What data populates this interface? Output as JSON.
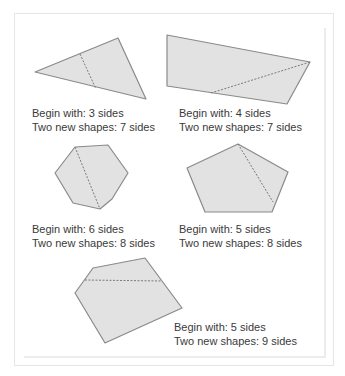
{
  "colors": {
    "shape_fill": "#e2e2e2",
    "shape_stroke": "#8a8a8a",
    "dash_stroke": "#7a7a7a",
    "text": "#3a3a3a"
  },
  "figures": [
    {
      "shape": "triangle",
      "begin_label": "Begin with: 3 sides",
      "result_label": "Two new shapes: 7 sides",
      "points": "35,72 118,38 146,99",
      "cut": [
        80,
        54,
        96,
        89
      ]
    },
    {
      "shape": "quadrilateral",
      "begin_label": "Begin with: 4 sides",
      "result_label": "Two new shapes: 7 sides",
      "points": "167,35 310,62 287,104 167,86",
      "cut": [
        211,
        93,
        310,
        62
      ]
    },
    {
      "shape": "hexagon",
      "begin_label": "Begin with: 6 sides",
      "result_label": "Two new shapes: 8 sides",
      "points": "75,147 108,145 128,173 112,199 100,209 73,203 55,173",
      "cut": [
        75,
        147,
        100,
        209
      ]
    },
    {
      "shape": "pentagon",
      "begin_label": "Begin with: 5 sides",
      "result_label": "Two new shapes: 8 sides",
      "points": "238,144 288,172 272,212 205,212 187,168",
      "cut": [
        238,
        144,
        273,
        202
      ]
    },
    {
      "shape": "pentagon",
      "begin_label": "Begin with: 5 sides",
      "result_label": "Two new shapes: 9 sides",
      "points": "93,268 145,258 182,308 105,343 75,293",
      "cut": [
        85,
        280,
        162,
        281
      ]
    }
  ]
}
